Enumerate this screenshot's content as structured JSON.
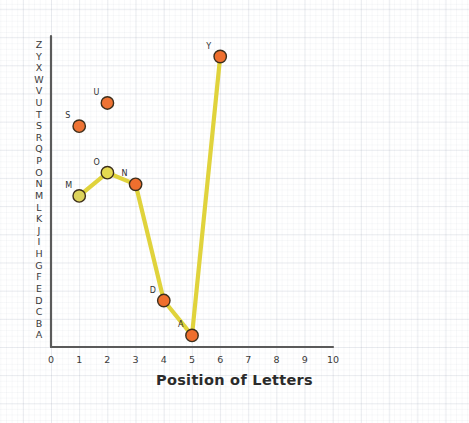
{
  "chart": {
    "title": "",
    "xlabel": "Position of Letters",
    "ylabel": ""
  },
  "chart_data": {
    "type": "scatter",
    "title": "",
    "xlabel": "Position of Letters",
    "ylabel": "",
    "grid": true,
    "legend": "none",
    "xlim": [
      0,
      10
    ],
    "xticks": [
      "0",
      "1",
      "2",
      "3",
      "4",
      "5",
      "6",
      "7",
      "8",
      "9",
      "10"
    ],
    "yticks": [
      "A",
      "B",
      "C",
      "D",
      "E",
      "F",
      "G",
      "H",
      "I",
      "J",
      "K",
      "L",
      "M",
      "N",
      "O",
      "P",
      "Q",
      "R",
      "S",
      "T",
      "U",
      "V",
      "W",
      "X",
      "Y",
      "Z"
    ],
    "ylim": [
      "A",
      "Z"
    ],
    "series": [
      {
        "name": "connected-path",
        "style": "line+markers",
        "line_color": "#e0d33c",
        "points": [
          {
            "label": "M",
            "x": 1,
            "y": "M",
            "y_index": 13,
            "marker_color": "#ddd35c"
          },
          {
            "label": "O",
            "x": 2,
            "y": "O",
            "y_index": 15,
            "marker_color": "#e5d950"
          },
          {
            "label": "N",
            "x": 3,
            "y": "N",
            "y_index": 14,
            "marker_color": "#ef6f2e"
          },
          {
            "label": "D",
            "x": 4,
            "y": "D",
            "y_index": 4,
            "marker_color": "#ef6f2e"
          },
          {
            "label": "A",
            "x": 5,
            "y": "A",
            "y_index": 1,
            "marker_color": "#ef6f2e"
          },
          {
            "label": "Y",
            "x": 6,
            "y": "Y",
            "y_index": 25,
            "marker_color": "#ef6f2e"
          }
        ]
      },
      {
        "name": "isolated-points",
        "style": "markers",
        "points": [
          {
            "label": "S",
            "x": 1,
            "y": "S",
            "y_index": 19,
            "marker_color": "#ee7334"
          },
          {
            "label": "U",
            "x": 2,
            "y": "U",
            "y_index": 21,
            "marker_color": "#ee7334"
          }
        ]
      }
    ],
    "colors": {
      "line": "#e0d33c",
      "marker_orange": "#ef6f2e",
      "marker_yellow": "#e3d857",
      "marker_stroke": "#3d2f1c",
      "axis": "#5a5a5a"
    }
  }
}
